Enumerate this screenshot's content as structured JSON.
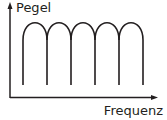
{
  "diagram": {
    "y_axis_label": "Pegel",
    "x_axis_label": "Frequenz",
    "lobe_count": 5,
    "colors": {
      "stroke": "#231f20",
      "background": "#ffffff"
    }
  }
}
